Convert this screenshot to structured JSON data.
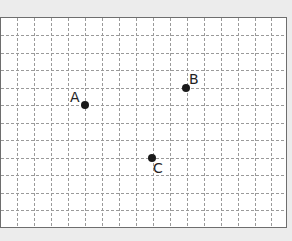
{
  "diagram": {
    "type": "coordinate-grid",
    "frame": {
      "x": 0,
      "y": 17,
      "width": 287,
      "height": 211,
      "border_color": "#6e6e6e",
      "background": "#ffffff"
    },
    "page_background": "#ececec",
    "grid": {
      "line_color": "#9a9a9a",
      "dash": "3,2",
      "vertical_x": [
        17,
        34,
        51,
        68,
        85,
        102,
        119,
        136,
        153,
        170,
        187,
        204,
        221,
        238,
        255,
        271
      ],
      "horizontal_y": [
        35,
        53,
        70,
        88,
        105,
        123,
        140,
        158,
        175,
        193,
        210
      ]
    },
    "points": [
      {
        "id": "A",
        "label": "A",
        "cx": 85,
        "cy": 105,
        "label_x": 70,
        "label_y": 90
      },
      {
        "id": "B",
        "label": "B",
        "cx": 186,
        "cy": 88,
        "label_x": 189,
        "label_y": 72
      },
      {
        "id": "C",
        "label": "C",
        "cx": 152,
        "cy": 158,
        "label_x": 153,
        "label_y": 161
      }
    ],
    "point_color": "#1a1a1a",
    "point_radius": 4
  }
}
